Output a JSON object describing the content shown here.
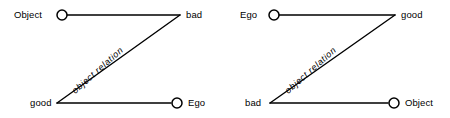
{
  "figure": {
    "type": "diagram",
    "background_color": "#ffffff",
    "line_color": "#000000",
    "text_color": "#000000",
    "node_marker": "hollow-circle",
    "diagrams": [
      {
        "id": "left",
        "top_left": "Object",
        "top_right": "bad",
        "bottom_left": "good",
        "bottom_right": "Ego",
        "relation": "object  relation",
        "marker_nodes": [
          "top_left",
          "bottom_right"
        ]
      },
      {
        "id": "right",
        "top_left": "Ego",
        "top_right": "good",
        "bottom_left": "bad",
        "bottom_right": "Object",
        "relation": "object  relation",
        "marker_nodes": [
          "top_left",
          "bottom_right"
        ]
      }
    ]
  }
}
